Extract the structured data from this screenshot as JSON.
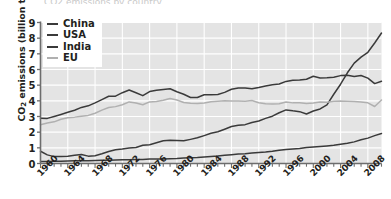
{
  "figure": {
    "cut_title": "CO2 emissions by country",
    "ylabel_main": "CO",
    "ylabel_sub": "2",
    "ylabel_rest": " emissions (billion t)"
  },
  "legend": {
    "position": "top-left",
    "items": [
      {
        "label": "China",
        "color": "#3a3a3a"
      },
      {
        "label": "USA",
        "color": "#3a3a3a"
      },
      {
        "label": "India",
        "color": "#3a3a3a"
      },
      {
        "label": "EU",
        "color": "#b0b0b0"
      }
    ]
  },
  "style": {
    "plot_background": "#e4e4e4",
    "gridline_color": "#ffffff",
    "axis_color": "#6d6d6d",
    "text_color": "#231f20",
    "page_background": "#ffffff"
  },
  "chart_data": {
    "type": "line",
    "title": "",
    "xlabel": "",
    "ylabel": "CO2 emissions (billion t)",
    "xlim": [
      1960,
      2010
    ],
    "ylim": [
      0,
      9
    ],
    "yticks": [
      0,
      1,
      2,
      3,
      4,
      5,
      6,
      7,
      8,
      9
    ],
    "xticks": [
      1960,
      1964,
      1968,
      1972,
      1976,
      1980,
      1984,
      1988,
      1992,
      1996,
      2000,
      2004,
      2008
    ],
    "xticks_minor_interval": 1,
    "grid": true,
    "legend_position": "top-left",
    "x": [
      1960,
      1961,
      1962,
      1963,
      1964,
      1965,
      1966,
      1967,
      1968,
      1969,
      1970,
      1971,
      1972,
      1973,
      1974,
      1975,
      1976,
      1977,
      1978,
      1979,
      1980,
      1981,
      1982,
      1983,
      1984,
      1985,
      1986,
      1987,
      1988,
      1989,
      1990,
      1991,
      1992,
      1993,
      1994,
      1995,
      1996,
      1997,
      1998,
      1999,
      2000,
      2001,
      2002,
      2003,
      2004,
      2005,
      2006,
      2007,
      2008,
      2009,
      2010
    ],
    "series": [
      {
        "name": "China",
        "color": "#3a3a3a",
        "values": [
          0.78,
          0.55,
          0.44,
          0.44,
          0.47,
          0.52,
          0.58,
          0.47,
          0.5,
          0.62,
          0.77,
          0.88,
          0.93,
          0.99,
          1.02,
          1.16,
          1.2,
          1.32,
          1.45,
          1.49,
          1.47,
          1.45,
          1.54,
          1.64,
          1.78,
          1.93,
          2.03,
          2.19,
          2.36,
          2.44,
          2.48,
          2.62,
          2.71,
          2.88,
          3.02,
          3.24,
          3.42,
          3.36,
          3.31,
          3.16,
          3.35,
          3.48,
          3.74,
          4.42,
          5.06,
          5.79,
          6.41,
          6.79,
          7.1,
          7.69,
          8.33
        ]
      },
      {
        "name": "USA",
        "color": "#3a3a3a",
        "values": [
          2.89,
          2.88,
          3.0,
          3.13,
          3.27,
          3.4,
          3.58,
          3.68,
          3.87,
          4.08,
          4.29,
          4.3,
          4.52,
          4.69,
          4.52,
          4.33,
          4.59,
          4.68,
          4.73,
          4.77,
          4.58,
          4.42,
          4.21,
          4.21,
          4.39,
          4.39,
          4.41,
          4.54,
          4.74,
          4.82,
          4.82,
          4.77,
          4.85,
          4.95,
          5.02,
          5.07,
          5.24,
          5.31,
          5.33,
          5.38,
          5.57,
          5.46,
          5.48,
          5.51,
          5.61,
          5.63,
          5.55,
          5.62,
          5.45,
          5.1,
          5.25
        ]
      },
      {
        "name": "India",
        "color": "#3a3a3a",
        "values": [
          0.12,
          0.13,
          0.14,
          0.15,
          0.16,
          0.17,
          0.18,
          0.18,
          0.19,
          0.2,
          0.21,
          0.22,
          0.24,
          0.24,
          0.25,
          0.26,
          0.28,
          0.29,
          0.29,
          0.31,
          0.32,
          0.35,
          0.37,
          0.39,
          0.42,
          0.45,
          0.48,
          0.52,
          0.56,
          0.6,
          0.63,
          0.67,
          0.71,
          0.74,
          0.78,
          0.85,
          0.89,
          0.93,
          0.96,
          1.02,
          1.06,
          1.09,
          1.12,
          1.16,
          1.23,
          1.29,
          1.38,
          1.51,
          1.62,
          1.78,
          1.92
        ]
      },
      {
        "name": "EU",
        "color": "#b0b0b0",
        "values": [
          2.48,
          2.58,
          2.66,
          2.82,
          2.92,
          2.96,
          3.02,
          3.07,
          3.21,
          3.41,
          3.57,
          3.63,
          3.75,
          3.93,
          3.86,
          3.75,
          3.93,
          3.96,
          4.04,
          4.15,
          4.05,
          3.89,
          3.84,
          3.83,
          3.86,
          3.94,
          3.97,
          4.01,
          3.99,
          3.99,
          3.97,
          4.02,
          3.88,
          3.81,
          3.79,
          3.82,
          3.93,
          3.87,
          3.88,
          3.83,
          3.86,
          3.92,
          3.91,
          3.98,
          3.99,
          3.97,
          3.96,
          3.92,
          3.87,
          3.64,
          4.05
        ]
      }
    ]
  }
}
